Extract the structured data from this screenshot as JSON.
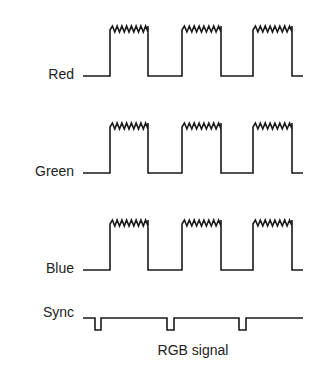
{
  "diagram": {
    "caption": "RGB signal",
    "signals": [
      {
        "name": "Red",
        "label": "Red",
        "baseline_y": 76,
        "top_y": 30
      },
      {
        "name": "Green",
        "label": "Green",
        "baseline_y": 173,
        "top_y": 127
      },
      {
        "name": "Blue",
        "label": "Blue",
        "baseline_y": 270,
        "top_y": 224
      }
    ],
    "sync": {
      "label": "Sync",
      "line_y": 318,
      "pulse_bottom_y": 330,
      "pulses_x": [
        [
          95,
          101
        ],
        [
          167,
          174
        ],
        [
          239,
          246
        ]
      ]
    },
    "pulses_x": [
      [
        110,
        148
      ],
      [
        182,
        221
      ],
      [
        253,
        292
      ]
    ],
    "line_color": "#1a1a1a"
  }
}
